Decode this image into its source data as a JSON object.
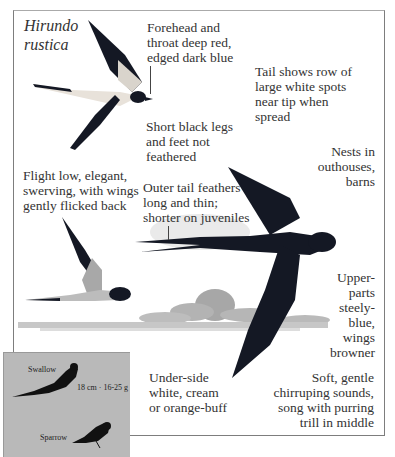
{
  "species": {
    "scientific_name_line1": "Hirundo",
    "scientific_name_line2": "rustica"
  },
  "annotations": {
    "forehead": [
      "Forehead and",
      "throat deep red,",
      "edged dark blue"
    ],
    "tail_spots": [
      "Tail shows row of",
      "large white spots",
      "near tip when",
      "spread"
    ],
    "legs": [
      "Short black legs",
      "and feet not",
      "feathered"
    ],
    "nests": [
      "Nests in",
      "outhouses,",
      "barns"
    ],
    "flight": [
      "Flight low, elegant,",
      "swerving, with wings",
      "gently flicked back"
    ],
    "outer_tail": [
      "Outer tail feathers",
      "long and thin;",
      "shorter on juveniles"
    ],
    "upperparts": [
      "Upper-",
      "parts",
      "steely-",
      "blue,",
      "wings",
      "browner"
    ],
    "underside": [
      "Under-side",
      "white, cream",
      "or orange-buff"
    ],
    "voice": [
      "Soft, gentle",
      "chirruping sounds,",
      "song with purring",
      "trill in middle"
    ]
  },
  "size_comparison": {
    "bird1": "Swallow",
    "bird1_size": "18 cm · 16-25 g",
    "bird2": "Sparrow"
  },
  "colors": {
    "frame_border": "#7d7d7d",
    "inset_bg": "#b9b9b9",
    "bird_dark": "#141824",
    "bird_pale": "#e8e2da"
  }
}
